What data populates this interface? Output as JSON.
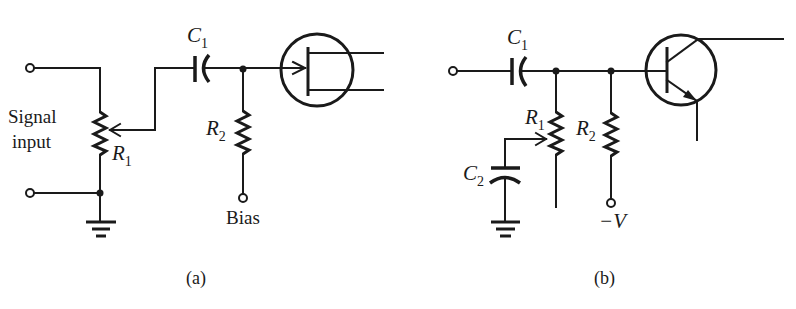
{
  "figure": {
    "panels": [
      {
        "id": "a",
        "caption": "(a)",
        "input_label_line1": "Signal",
        "input_label_line2": "input",
        "components": {
          "R1": {
            "letter": "R",
            "sub": "1",
            "type": "potentiometer"
          },
          "R2": {
            "letter": "R",
            "sub": "2",
            "type": "resistor"
          },
          "C1": {
            "letter": "C",
            "sub": "1",
            "type": "capacitor"
          },
          "transistor": {
            "type": "FET",
            "symbol": "fet-icon"
          }
        },
        "bias_label": "Bias"
      },
      {
        "id": "b",
        "caption": "(b)",
        "components": {
          "C1": {
            "letter": "C",
            "sub": "1",
            "type": "capacitor"
          },
          "C2": {
            "letter": "C",
            "sub": "2",
            "type": "capacitor"
          },
          "R1": {
            "letter": "R",
            "sub": "1",
            "type": "potentiometer"
          },
          "R2": {
            "letter": "R",
            "sub": "2",
            "type": "resistor"
          },
          "transistor": {
            "type": "NPN BJT",
            "symbol": "bjt-icon"
          }
        },
        "supply_label": "−V"
      }
    ],
    "colors": {
      "ink": "#1a1a1a",
      "background": "#ffffff"
    }
  }
}
